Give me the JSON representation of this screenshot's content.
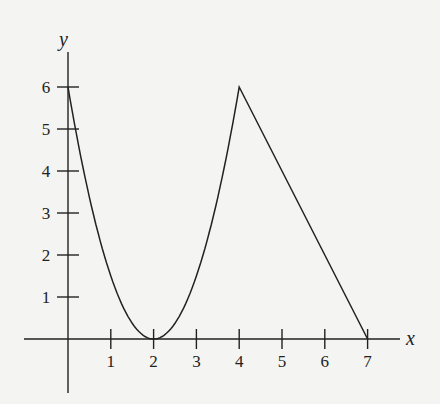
{
  "chart_data": {
    "type": "line",
    "title": "",
    "xlabel": "x",
    "ylabel": "y",
    "xlim": [
      -1,
      8
    ],
    "ylim": [
      -1.3,
      7
    ],
    "x_ticks": [
      1,
      2,
      3,
      4,
      5,
      6,
      7
    ],
    "y_ticks": [
      1,
      2,
      3,
      4,
      5,
      6
    ],
    "grid": false,
    "legend": null,
    "series": [
      {
        "name": "f(x)",
        "description": "Parabola y = 1.5(x-2)^2 on [0,4], then straight line from (4,6) to (7,0)",
        "points": [
          [
            0,
            6
          ],
          [
            0.5,
            3.375
          ],
          [
            1,
            1.5
          ],
          [
            1.5,
            0.375
          ],
          [
            2,
            0
          ],
          [
            2.5,
            0.375
          ],
          [
            3,
            1.5
          ],
          [
            3.5,
            3.375
          ],
          [
            4,
            6
          ],
          [
            5,
            4
          ],
          [
            6,
            2
          ],
          [
            7,
            0
          ]
        ]
      }
    ]
  },
  "labels": {
    "x_axis": "x",
    "y_axis": "y",
    "x_ticks": [
      "1",
      "2",
      "3",
      "4",
      "5",
      "6",
      "7"
    ],
    "y_ticks": [
      "1",
      "2",
      "3",
      "4",
      "5",
      "6"
    ]
  },
  "colors": {
    "background": "#f4f4f2",
    "ink": "#222222"
  }
}
